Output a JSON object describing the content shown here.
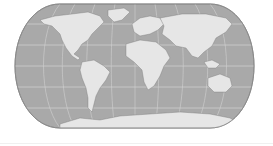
{
  "map": {
    "projection": "eckert-iv",
    "colors": {
      "ocean": "#a9a9a9",
      "land": "#e6e6e6",
      "graticule": "#d2d2d2",
      "outline": "#8a8a8a",
      "coast": "#7a7a7a",
      "background": "#ffffff"
    },
    "graticule": {
      "parallels_deg": [
        -60,
        -30,
        0,
        30,
        60
      ],
      "meridians_deg": [
        -150,
        -120,
        -90,
        -60,
        -30,
        0,
        30,
        60,
        90,
        120,
        150
      ]
    },
    "continents": [
      "North America",
      "Greenland",
      "South America",
      "Europe",
      "Africa",
      "Asia",
      "Australia",
      "Antarctica"
    ]
  }
}
